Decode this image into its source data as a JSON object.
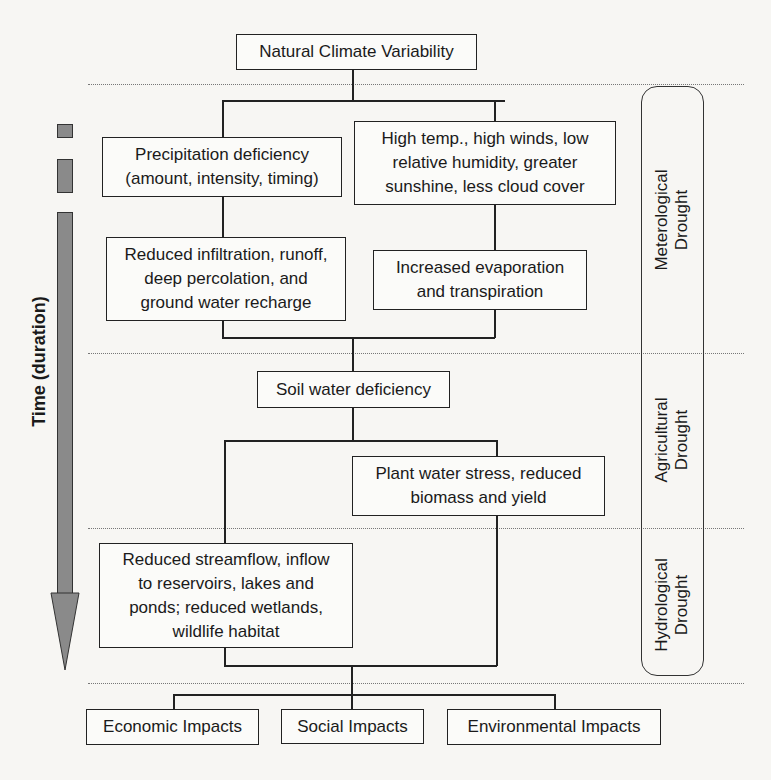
{
  "diagram": {
    "top": "Natural Climate Variability",
    "nodes": {
      "precipitation": "Precipitation deficiency\n(amount, intensity, timing)",
      "high_temp": "High temp., high winds, low\nrelative humidity, greater\nsunshine, less cloud cover",
      "reduced_infiltration": "Reduced infiltration, runoff,\ndeep percolation, and\nground water recharge",
      "evaporation": "Increased evaporation\nand transpiration",
      "soil_water": "Soil water deficiency",
      "plant_stress": "Plant water stress, reduced\nbiomass and yield",
      "streamflow": "Reduced streamflow, inflow\nto reservoirs, lakes and\nponds; reduced wetlands,\nwildlife habitat"
    },
    "impacts": [
      "Economic Impacts",
      "Social Impacts",
      "Environmental Impacts"
    ],
    "drought_types": [
      "Meterological\nDrought",
      "Agricultural\nDrought",
      "Hydrological\nDrought"
    ],
    "time_axis": "Time (duration)"
  }
}
